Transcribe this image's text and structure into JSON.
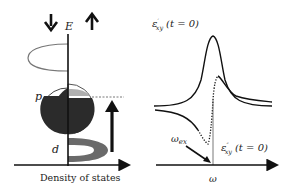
{
  "left_panel": {
    "axis_y_label": "E",
    "axis_x_label": "Density of states",
    "band_labels": {
      "p": "p",
      "d": "d"
    },
    "spin_down_icon": "arrow-down",
    "spin_up_icon": "arrow-up",
    "colors": {
      "dark_fill": "#2b2b2b",
      "gray_fill": "#6e6e6e",
      "light_fill": "#b5b5b5",
      "outline": "#555555"
    }
  },
  "right_panel": {
    "curve_top_label": {
      "symbol": "ε",
      "sup": "′",
      "sub": "xy",
      "arg": "(t = 0)"
    },
    "curve_bottom_label": {
      "symbol": "ε",
      "sup": "″",
      "sub": "xy",
      "arg": "(t = 0)"
    },
    "resonance_label": {
      "symbol": "ω",
      "sub": "ex"
    },
    "axis_x_label": "ω"
  }
}
